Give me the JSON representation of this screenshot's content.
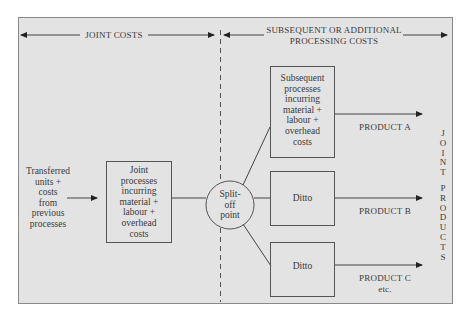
{
  "header": {
    "joint_costs_label": "JOINT COSTS",
    "subsequent_label_line1": "SUBSEQUENT OR ADDITIONAL",
    "subsequent_label_line2": "PROCESSING COSTS"
  },
  "input": {
    "lines": [
      "Transferred",
      "units +",
      "costs",
      "from",
      "previous",
      "processes"
    ]
  },
  "joint_process_box": {
    "lines": [
      "Joint",
      "processes",
      "incurring",
      "material +",
      "labour +",
      "overhead",
      "costs"
    ]
  },
  "split_off": {
    "lines": [
      "Split-",
      "off",
      "point"
    ]
  },
  "subsequent_boxes": [
    {
      "lines": [
        "Subsequent",
        "processes",
        "incurring",
        "material +",
        "labour +",
        "overhead",
        "costs"
      ],
      "product": "PRODUCT A",
      "product_note": ""
    },
    {
      "lines": [
        "Ditto"
      ],
      "product": "PRODUCT B",
      "product_note": ""
    },
    {
      "lines": [
        "Ditto"
      ],
      "product": "PRODUCT C",
      "product_note": "etc."
    }
  ],
  "side_label": {
    "word1": [
      "J",
      "O",
      "I",
      "N",
      "T"
    ],
    "word2": [
      "P",
      "R",
      "O",
      "D",
      "U",
      "C",
      "T",
      "S"
    ]
  },
  "colors": {
    "panel_bg": "#e3e3e3",
    "line": "#444444",
    "text": "#3a3a3a"
  }
}
